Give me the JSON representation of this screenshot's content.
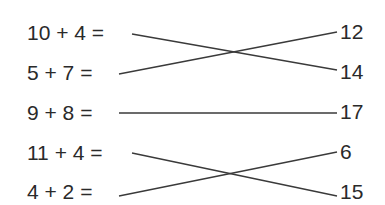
{
  "exercise": {
    "equations": [
      {
        "text": "10 + 4 ="
      },
      {
        "text": "5 + 7 ="
      },
      {
        "text": "9 + 8 ="
      },
      {
        "text": "11 + 4 ="
      },
      {
        "text": "4 + 2 ="
      }
    ],
    "answers": [
      {
        "text": "12"
      },
      {
        "text": "14"
      },
      {
        "text": "17"
      },
      {
        "text": "6"
      },
      {
        "text": "15"
      }
    ],
    "matches": [
      {
        "equation": "10 + 4 =",
        "answer": "14"
      },
      {
        "equation": "5 + 7 =",
        "answer": "12"
      },
      {
        "equation": "9 + 8 =",
        "answer": "17"
      },
      {
        "equation": "11 + 4 =",
        "answer": "15"
      },
      {
        "equation": "4 + 2 =",
        "answer": "6"
      }
    ],
    "line_color": "#3a3a3a"
  }
}
